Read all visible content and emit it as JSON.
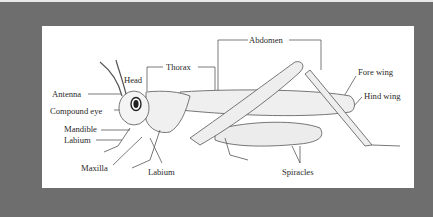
{
  "diagram": {
    "colors": {
      "frame": "#6e6e6e",
      "panel": "#ffffff",
      "ink": "#2a2a2a"
    },
    "labels": {
      "abdomen": "Abdomen",
      "thorax": "Thorax",
      "head": "Head",
      "antenna": "Antenna",
      "compound_eye": "Compound eye",
      "mandible": "Mandible",
      "labium_left": "Labium",
      "maxilla": "Maxilla",
      "labium_bottom": "Labium",
      "fore_wing": "Fore wing",
      "hind_wing": "Hind wing",
      "spiracles": "Spiracles"
    }
  }
}
